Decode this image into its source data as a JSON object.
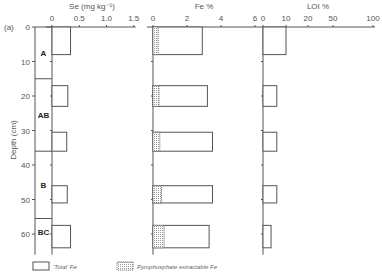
{
  "chart_data": {
    "type": "bar",
    "orientation": "horizontal",
    "panel_label": "(a)",
    "ylabel": "Depth (cm)",
    "depth_ticks": [
      0,
      10,
      20,
      30,
      40,
      50,
      60
    ],
    "depth_range": [
      0,
      66
    ],
    "horizons": [
      {
        "name": "A",
        "top": 0,
        "bottom": 15
      },
      {
        "name": "AB",
        "top": 15,
        "bottom": 36
      },
      {
        "name": "B",
        "top": 36,
        "bottom": 55.5
      },
      {
        "name": "BC",
        "top": 55.5,
        "bottom": 66
      }
    ],
    "samples": [
      {
        "top": 0,
        "bottom": 8
      },
      {
        "top": 17,
        "bottom": 23
      },
      {
        "top": 30.5,
        "bottom": 36
      },
      {
        "top": 46,
        "bottom": 51
      },
      {
        "top": 57.5,
        "bottom": 64
      }
    ],
    "panels": [
      {
        "key": "se",
        "title": "Se (mg kg⁻¹)",
        "ticks": [
          0,
          0.5,
          1.0,
          1.5
        ],
        "tick_labels": [
          "0",
          "0.5",
          "1.0",
          "1.5"
        ],
        "xlim": [
          0,
          1.5
        ],
        "scale": "linear",
        "series": [
          {
            "name": "Se",
            "values": [
              0.34,
              0.29,
              0.27,
              0.28,
              0.34
            ]
          }
        ]
      },
      {
        "key": "fe",
        "title": "Fe %",
        "ticks": [
          0,
          2,
          4,
          6
        ],
        "tick_labels": [
          "0",
          "2",
          "4",
          "6"
        ],
        "xlim": [
          0,
          6
        ],
        "scale": "linear",
        "series": [
          {
            "name": "'Total' Fe",
            "values": [
              2.9,
              3.2,
              3.5,
              3.5,
              3.3
            ]
          },
          {
            "name": "Pyrophosphate extractable Fe",
            "values": [
              0.3,
              0.35,
              0.4,
              0.5,
              0.65
            ],
            "hatched": true
          }
        ]
      },
      {
        "key": "loi",
        "title": "LOI %",
        "ticks": [
          0,
          10,
          20,
          50,
          100
        ],
        "tick_labels": [
          "0",
          "10",
          "20",
          "50",
          "100"
        ],
        "xlim": [
          0,
          100
        ],
        "scale": "nonlinear",
        "series": [
          {
            "name": "LOI",
            "values": [
              10,
              6,
              6,
              6,
              3.5
            ]
          }
        ]
      }
    ],
    "legend": [
      {
        "label": "'Total' Fe",
        "style": "open"
      },
      {
        "label": "Pyrophosphate extractable Fe",
        "style": "stippled"
      }
    ]
  }
}
